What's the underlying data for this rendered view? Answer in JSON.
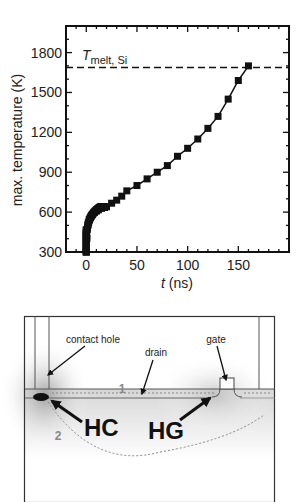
{
  "chart_data": {
    "type": "line",
    "title": "",
    "xlabel": "t (ns)",
    "ylabel": "max. temperature (K)",
    "xlim": [
      -20,
      200
    ],
    "ylim": [
      300,
      2000
    ],
    "xticks": [
      0,
      50,
      100,
      150
    ],
    "yticks": [
      300,
      600,
      900,
      1200,
      1500,
      1800
    ],
    "grid": false,
    "legend": null,
    "annotations": [
      {
        "text": "T_melt, Si",
        "type": "hline",
        "y": 1687,
        "style": "dashed"
      }
    ],
    "series": [
      {
        "name": "max. temperature",
        "marker": "square",
        "x": [
          0,
          0.2,
          0.5,
          1,
          1.5,
          2,
          3,
          4,
          5,
          6,
          8,
          10,
          12,
          15,
          18,
          20,
          25,
          30,
          35,
          40,
          50,
          60,
          70,
          80,
          90,
          100,
          110,
          120,
          130,
          140,
          150,
          160
        ],
        "values": [
          300,
          360,
          420,
          470,
          500,
          520,
          545,
          560,
          572,
          582,
          597,
          608,
          617,
          628,
          635,
          640,
          667,
          690,
          720,
          760,
          800,
          850,
          900,
          950,
          1020,
          1080,
          1150,
          1230,
          1320,
          1450,
          1590,
          1700
        ]
      }
    ]
  },
  "labels": {
    "melt_main": "T",
    "melt_sub": "melt, Si",
    "xlabel_italic": "t",
    "xlabel_rest": " (ns)",
    "ylabel": "max. temperature (K)"
  },
  "diagram": {
    "labels": {
      "contact_hole": "contact hole",
      "drain": "drain",
      "gate": "gate",
      "path1": "1",
      "path2": "2",
      "hc": "HC",
      "hg": "HG"
    }
  }
}
